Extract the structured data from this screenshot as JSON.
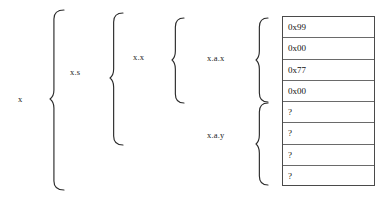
{
  "figure": {
    "background_color": "#ffffff",
    "stroke_color": "#2b2b2b",
    "table_border_color": "#4a4a4a",
    "text_color": "#111111"
  },
  "braces": [
    {
      "id": "brace-x",
      "label": "x",
      "label_x": 18,
      "label_y": 99,
      "tip_x": 50,
      "tip_y": 99,
      "left": 50,
      "top": 10,
      "bottom": 190,
      "width": 14
    },
    {
      "id": "brace-xs",
      "label": "x.s",
      "label_x": 70,
      "label_y": 72,
      "tip_x": 110,
      "tip_y": 78,
      "left": 110,
      "top": 13,
      "bottom": 145,
      "width": 13
    },
    {
      "id": "brace-xx",
      "label": "x.x",
      "label_x": 133,
      "label_y": 57,
      "tip_x": 172,
      "tip_y": 60,
      "left": 172,
      "top": 18,
      "bottom": 103,
      "width": 12
    },
    {
      "id": "brace-xax",
      "label": "x.a.x",
      "label_x": 207,
      "label_y": 58,
      "tip_x": 256,
      "tip_y": 60,
      "left": 256,
      "top": 18,
      "bottom": 102,
      "width": 12
    },
    {
      "id": "brace-xay",
      "label": "x.a.y",
      "label_x": 207,
      "label_y": 135,
      "tip_x": 256,
      "tip_y": 144,
      "left": 256,
      "top": 103,
      "bottom": 185,
      "width": 12
    }
  ],
  "memory_table": {
    "name": "memory-cells",
    "left": 282,
    "top": 16,
    "width": 93,
    "height": 170,
    "rows": [
      {
        "value": "0x99"
      },
      {
        "value": "0x00"
      },
      {
        "value": "0x77"
      },
      {
        "value": "0x00"
      },
      {
        "value": "?"
      },
      {
        "value": "?"
      },
      {
        "value": "?"
      },
      {
        "value": "?"
      }
    ]
  }
}
